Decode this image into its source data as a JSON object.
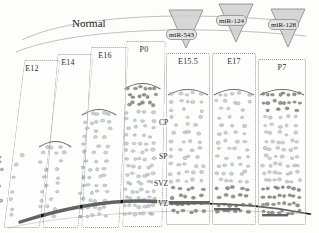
{
  "figure": {
    "title": "Normal"
  },
  "columns": [
    {
      "id": "E12",
      "label": "E12",
      "x": 14,
      "y": 60,
      "w": 36,
      "h": 168,
      "skew": -7,
      "cell_top": 150,
      "density": "very-low",
      "cap": false
    },
    {
      "id": "E14",
      "label": "E14",
      "x": 50,
      "y": 54,
      "w": 36,
      "h": 174,
      "skew": -5,
      "cell_top": 140,
      "density": "low",
      "cap": true
    },
    {
      "id": "E16",
      "label": "E16",
      "x": 86,
      "y": 47,
      "w": 38,
      "h": 181,
      "skew": -3,
      "cell_top": 108,
      "density": "medium",
      "cap": true
    },
    {
      "id": "P0",
      "label": "P0",
      "x": 124,
      "y": 41,
      "w": 40,
      "h": 186,
      "skew": -1,
      "cell_top": 82,
      "density": "high",
      "cap": true
    },
    {
      "id": "E15.5",
      "label": "E15.5",
      "x": 166,
      "y": 53,
      "w": 44,
      "h": 172,
      "skew": 0,
      "cell_top": 88,
      "density": "medium",
      "cap": true
    },
    {
      "id": "E17",
      "label": "E17",
      "x": 212,
      "y": 53,
      "w": 44,
      "h": 172,
      "skew": 0,
      "cell_top": 88,
      "density": "medium",
      "cap": true
    },
    {
      "id": "P7",
      "label": "P7",
      "x": 258,
      "y": 59,
      "w": 48,
      "h": 166,
      "skew": 0,
      "cell_top": 88,
      "density": "high",
      "cap": true
    }
  ],
  "layer_labels": [
    {
      "id": "CP",
      "text": "CP",
      "x": 158,
      "y": 118
    },
    {
      "id": "SP",
      "text": "SP",
      "x": 158,
      "y": 152
    },
    {
      "id": "SVZ",
      "text": "SVZ",
      "x": 153,
      "y": 179
    },
    {
      "id": "VZ",
      "text": "VZ",
      "x": 157,
      "y": 199
    }
  ],
  "mirnas": [
    {
      "id": "miR-543",
      "label": "miR-543",
      "target_column": "E15.5",
      "tri_cx": 186,
      "tri_top": 10,
      "tri_w": 34,
      "tri_h": 38,
      "label_x": 166,
      "label_y": 29
    },
    {
      "id": "miR-124",
      "label": "miR-124",
      "target_column": "E17",
      "tri_cx": 236,
      "tri_top": 4,
      "tri_w": 34,
      "tri_h": 38,
      "label_x": 216,
      "label_y": 15
    },
    {
      "id": "miR-128",
      "label": "miR-128",
      "target_column": "P7",
      "tri_cx": 288,
      "tri_top": 9,
      "tri_w": 34,
      "tri_h": 38,
      "label_x": 268,
      "label_y": 19
    }
  ],
  "colors": {
    "cell_fill": "#8e95a6",
    "cell_stroke": "#5d6474",
    "dense_cell": "#3a3a3a",
    "ventricle_band": "#111111",
    "arc_line": "#b6b6b6",
    "box_border": "#9a9a9a",
    "triangle_fill": "#cfcfcf",
    "triangle_stroke": "#8f8f8f",
    "background": "#fdfdfc"
  },
  "chart_data": {
    "type": "diagram",
    "title": "Normal",
    "xlabel": "Developmental stage",
    "ylabel": "Cortical layer",
    "categories": [
      "E12",
      "E14",
      "E16",
      "P0",
      "E15.5",
      "E17",
      "P7"
    ],
    "layers": [
      "CP",
      "SP",
      "SVZ",
      "VZ"
    ],
    "series": [
      {
        "name": "cortical-thickness-relative",
        "values": [
          10,
          25,
          55,
          80,
          72,
          76,
          88
        ]
      },
      {
        "name": "cell-density-relative",
        "values": [
          8,
          22,
          50,
          85,
          68,
          72,
          92
        ]
      }
    ],
    "annotations": [
      "miR-543",
      "miR-124",
      "miR-128"
    ]
  }
}
